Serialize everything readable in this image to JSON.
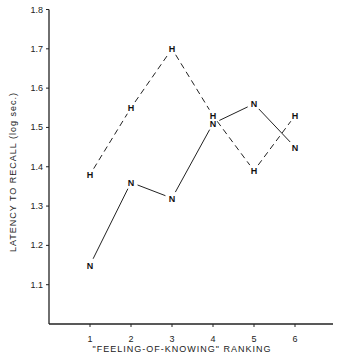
{
  "chart_data": {
    "type": "line",
    "title": "",
    "xlabel": "\"FEELING-OF-KNOWING\" RANKING",
    "ylabel": "LATENCY TO RECALL (log sec.)",
    "x": [
      1,
      2,
      3,
      4,
      5,
      6
    ],
    "xticks": [
      "1",
      "2",
      "3",
      "4",
      "5",
      "6"
    ],
    "yticks": [
      "1.1",
      "1.2",
      "1.3",
      "1.4",
      "1.5",
      "1.6",
      "1.7",
      "1.8"
    ],
    "ylim": [
      1.0,
      1.8
    ],
    "grid": false,
    "legend": "none (series marked by letters H and N on points)",
    "series": [
      {
        "name": "H",
        "marker": "H",
        "linestyle": "dashed",
        "values": [
          1.38,
          1.55,
          1.7,
          1.53,
          1.39,
          1.53
        ]
      },
      {
        "name": "N",
        "marker": "N",
        "linestyle": "solid",
        "values": [
          1.15,
          1.36,
          1.32,
          1.51,
          1.56,
          1.45
        ]
      }
    ]
  }
}
